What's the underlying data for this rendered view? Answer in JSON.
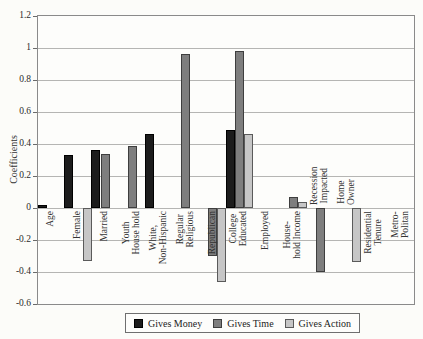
{
  "figure": {
    "y_axis_title": "Coefficients",
    "y_tick_labels": [
      "1.2",
      "1",
      "0.8",
      "0.6",
      "0.4",
      "0.2",
      "0",
      "-0.2",
      "-0.4",
      "-0.6"
    ]
  },
  "chart_data": {
    "type": "bar",
    "title": "",
    "xlabel": "",
    "ylabel": "Coefficients",
    "ylim": [
      -0.6,
      1.2
    ],
    "ytick_step": 0.2,
    "grid": true,
    "legend_position": "bottom",
    "categories": [
      "Age",
      "Female",
      "Married",
      "Youth\nHouse hold",
      "White,\nNon-Hispanic",
      "Regular\nReligious",
      "Republican",
      "College\nEducated",
      "Employed",
      "House-\nhold Income",
      "Recession\nImpacted",
      "Home\nOwner",
      "Residential\nTenure",
      "Metro-\nPolitan"
    ],
    "category_label_side": [
      "below",
      "below",
      "below",
      "below",
      "below",
      "below",
      "below",
      "below",
      "below",
      "below",
      "above",
      "above",
      "below",
      "below"
    ],
    "series": [
      {
        "name": "Gives Money",
        "color": "#1c1c1c",
        "edge": "#000000",
        "values": [
          0.02,
          0.33,
          0.36,
          null,
          0.46,
          null,
          null,
          0.49,
          null,
          null,
          null,
          null,
          null,
          null
        ]
      },
      {
        "name": "Gives Time",
        "color": "#7e7e7e",
        "edge": "#3e3e3e",
        "values": [
          null,
          null,
          0.34,
          0.39,
          null,
          0.96,
          -0.3,
          0.98,
          null,
          0.07,
          -0.4,
          null,
          null,
          null
        ]
      },
      {
        "name": "Gives Action",
        "color": "#c6c6c6",
        "edge": "#5a5a5a",
        "values": [
          null,
          -0.33,
          null,
          null,
          null,
          null,
          -0.46,
          0.46,
          null,
          0.04,
          null,
          -0.34,
          null,
          null
        ]
      }
    ]
  }
}
